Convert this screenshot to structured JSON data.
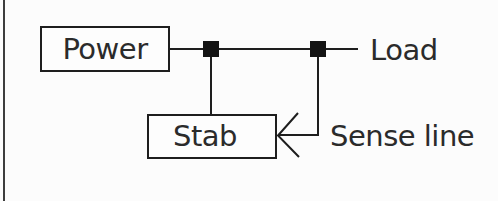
{
  "figure": {
    "power_box": {
      "label": "Power"
    },
    "stab_box": {
      "label": "Stab"
    },
    "load_label": "Load",
    "sense_line_label": "Sense line",
    "colors": {
      "line": "#1e1e1e",
      "junction": "#141414",
      "text": "#2b2b2b",
      "background": "#fcfcfc",
      "frame_border": "#3d3d3d"
    }
  }
}
